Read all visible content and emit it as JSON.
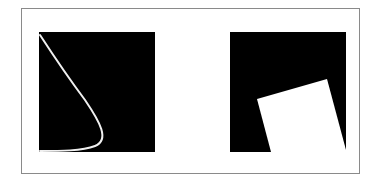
{
  "figure": {
    "frame": {
      "x": 21,
      "y": 8,
      "width": 339,
      "height": 166,
      "stroke": "#8a8a8a"
    },
    "panels": [
      {
        "name": "left-panel",
        "square": {
          "x": 39,
          "y": 32,
          "width": 116,
          "height": 120,
          "fill": "#000000"
        },
        "curve": {
          "stroke": "#f0f0f0",
          "stroke_width": 2,
          "path": "M40,35 C55,58 70,80 85,100 C100,122 110,140 95,146 C82,151 60,151 40,151"
        }
      },
      {
        "name": "right-panel",
        "square": {
          "x": 230,
          "y": 32,
          "width": 116,
          "height": 120,
          "fill": "#000000"
        },
        "polygon": {
          "fill": "#ffffff",
          "points": "257,99 327,79 346,150 346,152 271,152"
        }
      }
    ]
  }
}
